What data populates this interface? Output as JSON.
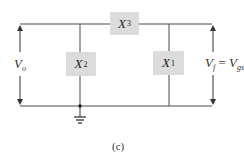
{
  "diagram": {
    "type": "circuit-schematic",
    "caption": "(c)",
    "components": [
      {
        "id": "X3",
        "symbol": "X",
        "subscript": "3",
        "position": "top series branch"
      },
      {
        "id": "X2",
        "symbol": "X",
        "subscript": "2",
        "position": "left shunt branch"
      },
      {
        "id": "X1",
        "symbol": "X",
        "subscript": "1",
        "position": "right shunt branch"
      }
    ],
    "labels": {
      "left_voltage": {
        "symbol": "V",
        "subscript": "o"
      },
      "right_voltage": {
        "lhs_symbol": "V",
        "lhs_subscript": "f",
        "equals": "=",
        "rhs_symbol": "V",
        "rhs_subscript": "gs"
      }
    },
    "ground": "ground symbol below X2 node",
    "colors": {
      "wire": "#4a4a4a",
      "component_fill": "#dcdcdc",
      "text": "#222222"
    }
  }
}
